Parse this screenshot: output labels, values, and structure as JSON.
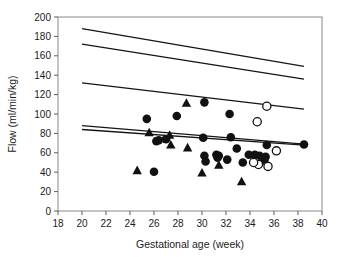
{
  "chart_data": {
    "type": "scatter",
    "title": "",
    "xlabel": "Gestational age (week)",
    "ylabel": "Flow (ml/min/kg)",
    "xlim": [
      18,
      40
    ],
    "ylim": [
      0,
      200
    ],
    "xticks": [
      18,
      20,
      22,
      24,
      26,
      28,
      30,
      32,
      34,
      36,
      38,
      40
    ],
    "yticks": [
      0,
      20,
      40,
      60,
      80,
      100,
      120,
      140,
      160,
      180,
      200
    ],
    "grid": false,
    "legend_position": "none",
    "series": [
      {
        "name": "filled-circle",
        "marker": "filled circle",
        "color": "#111111",
        "points": [
          [
            25.4,
            95
          ],
          [
            26.0,
            40.5
          ],
          [
            27.9,
            98
          ],
          [
            30.2,
            112
          ],
          [
            30.1,
            75.5
          ],
          [
            30.2,
            57
          ],
          [
            30.3,
            51
          ],
          [
            31.2,
            58
          ],
          [
            31.4,
            57
          ],
          [
            31.3,
            55
          ],
          [
            32.3,
            100
          ],
          [
            32.4,
            76
          ],
          [
            32.1,
            53
          ],
          [
            32.9,
            64.5
          ],
          [
            33.4,
            50
          ],
          [
            33.9,
            58
          ],
          [
            34.4,
            58
          ],
          [
            34.8,
            57
          ],
          [
            35.2,
            52
          ],
          [
            35.4,
            68
          ],
          [
            35.3,
            56
          ],
          [
            38.5,
            68.5
          ],
          [
            26.4,
            73
          ],
          [
            26.2,
            72
          ],
          [
            27.0,
            74
          ]
        ]
      },
      {
        "name": "filled-triangle",
        "marker": "filled triangle",
        "color": "#111111",
        "points": [
          [
            24.6,
            41.5
          ],
          [
            25.6,
            80.5
          ],
          [
            27.3,
            78
          ],
          [
            27.4,
            68
          ],
          [
            28.7,
            111
          ],
          [
            28.8,
            65
          ],
          [
            30.0,
            39
          ],
          [
            31.4,
            47
          ],
          [
            33.3,
            30
          ]
        ]
      },
      {
        "name": "open-circle",
        "marker": "open circle",
        "color": "#111111",
        "points": [
          [
            35.4,
            108
          ],
          [
            34.6,
            92
          ],
          [
            36.2,
            62
          ],
          [
            34.7,
            48
          ],
          [
            35.5,
            46
          ],
          [
            34.3,
            50
          ]
        ]
      }
    ],
    "reference_lines": [
      {
        "name": "line-1-upper",
        "x": [
          20,
          38.5
        ],
        "y": [
          188,
          149
        ]
      },
      {
        "name": "line-2",
        "x": [
          20,
          38.5
        ],
        "y": [
          172,
          136
        ]
      },
      {
        "name": "line-3",
        "x": [
          20,
          38.5
        ],
        "y": [
          132,
          105
        ]
      },
      {
        "name": "line-4",
        "x": [
          20,
          38.5
        ],
        "y": [
          88,
          69
        ]
      },
      {
        "name": "line-5-lower",
        "x": [
          20,
          38.5
        ],
        "y": [
          84,
          68
        ]
      }
    ]
  }
}
